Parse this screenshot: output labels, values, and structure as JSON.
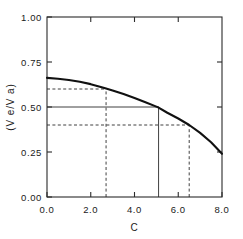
{
  "chart_data": {
    "type": "line",
    "title": "",
    "subtitle": "",
    "xlabel": "C",
    "ylabel": "(V e/V a)",
    "xlim": [
      0.0,
      8.0
    ],
    "ylim": [
      0.0,
      1.0
    ],
    "grid": false,
    "legend": "none",
    "x_ticks": [
      0.0,
      2.0,
      4.0,
      6.0,
      8.0
    ],
    "x_tick_labels": [
      "0.0",
      "2.0",
      "4.0",
      "6.0",
      "8.0"
    ],
    "y_ticks": [
      0.0,
      0.25,
      0.5,
      0.75,
      1.0
    ],
    "y_tick_labels": [
      "0.00",
      "0.25",
      "0.50",
      "0.75",
      "1.00"
    ],
    "series": [
      {
        "name": "Ve/Va vs C",
        "style": "solid-thick",
        "color": "#111111",
        "x": [
          0.0,
          0.5,
          1.0,
          1.5,
          2.0,
          2.5,
          2.7,
          3.0,
          3.5,
          4.0,
          4.5,
          5.0,
          5.1,
          5.5,
          6.0,
          6.5,
          7.0,
          7.5,
          8.0
        ],
        "y": [
          0.662,
          0.657,
          0.65,
          0.64,
          0.627,
          0.61,
          0.603,
          0.592,
          0.572,
          0.55,
          0.526,
          0.502,
          0.497,
          0.468,
          0.436,
          0.4,
          0.356,
          0.304,
          0.24
        ]
      }
    ],
    "reference_lines": [
      {
        "name": "midpoint-horizontal",
        "orientation": "horizontal",
        "style": "solid",
        "value": 0.5,
        "from_x": 0.0,
        "to_x": 5.1
      },
      {
        "name": "midpoint-vertical",
        "orientation": "vertical",
        "style": "solid",
        "value": 5.1,
        "from_y": 0.0,
        "to_y": 0.5
      },
      {
        "name": "upper-horizontal",
        "orientation": "horizontal",
        "style": "dashed",
        "value": 0.6,
        "from_x": 0.0,
        "to_x": 2.7
      },
      {
        "name": "upper-vertical",
        "orientation": "vertical",
        "style": "dashed",
        "value": 2.7,
        "from_y": 0.0,
        "to_y": 0.6
      },
      {
        "name": "lower-horizontal",
        "orientation": "horizontal",
        "style": "dashed",
        "value": 0.4,
        "from_x": 0.0,
        "to_x": 6.5
      },
      {
        "name": "lower-vertical",
        "orientation": "vertical",
        "style": "dashed",
        "value": 6.5,
        "from_y": 0.0,
        "to_y": 0.4
      }
    ],
    "annotations": []
  },
  "axis": {
    "x_label": "C",
    "y_label": "(V e/V a)",
    "x_tick_0": "0.0",
    "x_tick_1": "2.0",
    "x_tick_2": "4.0",
    "x_tick_3": "6.0",
    "x_tick_4": "8.0",
    "y_tick_0": "0.00",
    "y_tick_1": "0.25",
    "y_tick_2": "0.50",
    "y_tick_3": "0.75",
    "y_tick_4": "1.00"
  },
  "style": {
    "curve_color": "#111111",
    "axis_color": "#2b2b2b",
    "background": "#ffffff"
  }
}
